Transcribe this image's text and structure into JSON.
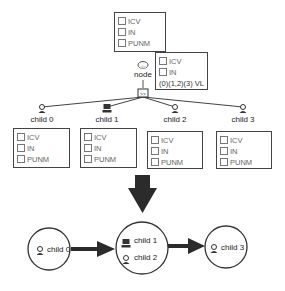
{
  "top_box": {
    "items": [
      "ICV",
      "IN",
      "PUNM"
    ]
  },
  "node": {
    "label": "node",
    "icon": "cloud-icon",
    "switch_icon": "switch-icon",
    "box": {
      "items": [
        "ICV",
        "IN"
      ],
      "footer": "(0)(1,2)(3)  VL"
    }
  },
  "children": [
    {
      "label": "child 0",
      "icon": "user-icon",
      "items": [
        "ICV",
        "IN",
        "PUNM"
      ]
    },
    {
      "label": "child 1",
      "icon": "computer-icon",
      "items": [
        "ICV",
        "IN",
        "PUNM"
      ]
    },
    {
      "label": "child 2",
      "icon": "user-icon",
      "items": [
        "ICV",
        "IN",
        "PUNM"
      ]
    },
    {
      "label": "child 3",
      "icon": "user-icon",
      "items": [
        "ICV",
        "IN",
        "PUNM"
      ]
    }
  ],
  "groups": [
    {
      "members": [
        {
          "label": "child 0",
          "icon": "user-icon"
        }
      ]
    },
    {
      "members": [
        {
          "label": "child 1",
          "icon": "computer-icon"
        },
        {
          "label": "child 2",
          "icon": "user-icon"
        }
      ]
    },
    {
      "members": [
        {
          "label": "child 3",
          "icon": "user-icon"
        }
      ]
    }
  ],
  "colors": {
    "stroke": "#333333",
    "arrow": "#2b2b2b"
  }
}
